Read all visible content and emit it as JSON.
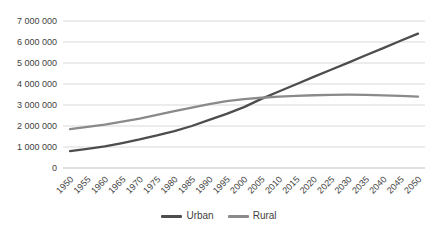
{
  "chart_data": {
    "type": "line",
    "x": [
      1950,
      1955,
      1960,
      1965,
      1970,
      1975,
      1980,
      1985,
      1990,
      1995,
      2000,
      2005,
      2010,
      2015,
      2020,
      2025,
      2030,
      2035,
      2040,
      2045,
      2050
    ],
    "series": [
      {
        "name": "Urban",
        "color": "#4d4d4d",
        "values": [
          800000,
          910000,
          1030000,
          1190000,
          1360000,
          1550000,
          1760000,
          2000000,
          2290000,
          2580000,
          2900000,
          3290000,
          3640000,
          3990000,
          4340000,
          4680000,
          5020000,
          5370000,
          5710000,
          6060000,
          6400000
        ]
      },
      {
        "name": "Rural",
        "color": "#8a8a8a",
        "values": [
          1850000,
          1960000,
          2070000,
          2210000,
          2350000,
          2525000,
          2705000,
          2880000,
          3040000,
          3185000,
          3280000,
          3345000,
          3395000,
          3430000,
          3465000,
          3485000,
          3490000,
          3480000,
          3460000,
          3435000,
          3400000
        ]
      }
    ],
    "title": "",
    "xlabel": "",
    "ylabel": "",
    "ylim": [
      0,
      7000000
    ],
    "y_ticks": [
      0,
      1000000,
      2000000,
      3000000,
      4000000,
      5000000,
      6000000,
      7000000
    ],
    "y_tick_labels": [
      "0",
      "1 000 000",
      "2 000 000",
      "3 000 000",
      "4 000 000",
      "5 000 000",
      "6 000 000",
      "7 000 000"
    ],
    "x_tick_labels": [
      "1950",
      "1955",
      "1960",
      "1965",
      "1970",
      "1975",
      "1980",
      "1985",
      "1990",
      "1995",
      "2000",
      "2005",
      "2010",
      "2015",
      "2020",
      "2025",
      "2030",
      "2035",
      "2040",
      "2045",
      "2050"
    ],
    "grid": true,
    "legend_position": "bottom",
    "gridline_color": "#d9d9d9",
    "axis_line_color": "#bfbfbf",
    "axis_text_color": "#3f3f3f",
    "background_color": "#ffffff"
  }
}
